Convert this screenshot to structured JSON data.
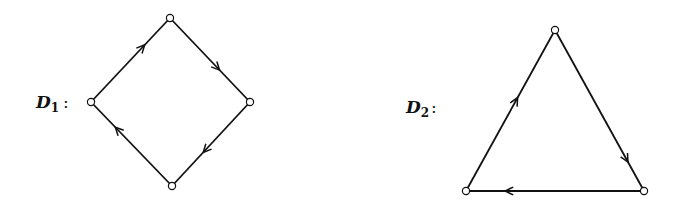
{
  "diagrams": [
    {
      "label": "D",
      "subscript": "1",
      "suffix": ":",
      "shape": "diamond",
      "vertices": [
        {
          "name": "top",
          "x": 170,
          "y": 18
        },
        {
          "name": "right",
          "x": 250,
          "y": 102
        },
        {
          "name": "bottom",
          "x": 172,
          "y": 186
        },
        {
          "name": "left",
          "x": 91,
          "y": 102
        }
      ],
      "edges": [
        {
          "from": "left",
          "to": "top",
          "arrow_t": 0.68
        },
        {
          "from": "top",
          "to": "right",
          "arrow_t": 0.62
        },
        {
          "from": "right",
          "to": "bottom",
          "arrow_t": 0.6
        },
        {
          "from": "bottom",
          "to": "left",
          "arrow_t": 0.7
        }
      ]
    },
    {
      "label": "D",
      "subscript": "2",
      "suffix": ":",
      "shape": "triangle",
      "vertices": [
        {
          "name": "top",
          "x": 555,
          "y": 30
        },
        {
          "name": "right",
          "x": 644,
          "y": 191
        },
        {
          "name": "left",
          "x": 466,
          "y": 191
        }
      ],
      "edges": [
        {
          "from": "left",
          "to": "top",
          "arrow_t": 0.58
        },
        {
          "from": "top",
          "to": "right",
          "arrow_t": 0.82
        },
        {
          "from": "right",
          "to": "left",
          "arrow_t": 0.78
        }
      ]
    }
  ],
  "colors": {
    "stroke": "#111111",
    "vertex_fill": "#ffffff",
    "background": "#ffffff"
  }
}
